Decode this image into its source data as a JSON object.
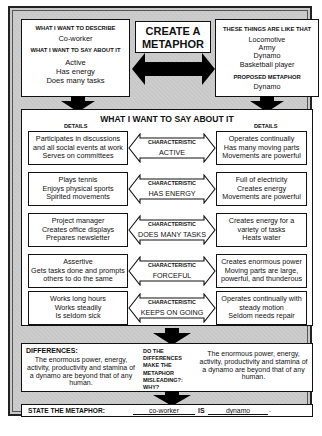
{
  "title": "CREATE A METAPHOR",
  "title_lines": [
    "CREATE A",
    "METAPHOR"
  ],
  "describe": {
    "label": "WHAT I WANT TO DESCRIBE",
    "value": "Co-worker",
    "say_label": "WHAT I WANT TO SAY ABOUT IT",
    "say_items": [
      "Active",
      "Has energy",
      "Does many tasks"
    ]
  },
  "like_that": {
    "label": "THESE THINGS ARE LIKE THAT",
    "items": [
      "Locomotive",
      "Army",
      "Dynamo",
      "Basketball player"
    ],
    "proposed_label": "PROPOSED METAPHOR",
    "proposed_value": "Dynamo"
  },
  "say_section": {
    "title": "WHAT I WANT TO SAY ABOUT IT",
    "left_header": "DETAILS",
    "right_header": "DETAILS",
    "characteristic_label": "CHARACTERISTIC",
    "rows": [
      {
        "left": [
          "Participates in discussions",
          "and all social events at work",
          "Serves on committees"
        ],
        "characteristic": "ACTIVE",
        "right": [
          "Operates continually",
          "Has many moving parts",
          "Movements are powerful"
        ]
      },
      {
        "left": [
          "Plays tennis",
          "Enjoys physical sports",
          "Spirited movements"
        ],
        "characteristic": "HAS ENERGY",
        "right": [
          "Full of electricity",
          "Creates energy",
          "Movements are powerful"
        ]
      },
      {
        "left": [
          "Project manager",
          "Creates office displays",
          "Prepares newsletter"
        ],
        "characteristic": "DOES MANY TASKS",
        "right": [
          "Creates energy for a",
          "variety of tasks",
          "Heats water"
        ]
      },
      {
        "left": [
          "Assertive",
          "Gets tasks done and prompts",
          "others to do the same"
        ],
        "characteristic": "FORCEFUL",
        "right": [
          "Creates enormous power",
          "Moving parts are large,",
          "powerful, and thunderous"
        ]
      },
      {
        "left": [
          "Works long hours",
          "Works steadily",
          "Is seldom sick"
        ],
        "characteristic": "KEEPS ON GOING",
        "right": [
          "Operates continually with",
          "steady motion",
          "Seldom needs repair"
        ]
      }
    ]
  },
  "differences": {
    "label": "DIFFERENCES:",
    "text": "The enormous power, energy, activity, productivity and stamina of a dynamo are beyond that of any human.",
    "question": "DO THE DIFFERENCES MAKE THE METAPHOR MISLEADING?: WHY?",
    "question_lines": [
      "DO THE",
      "DIFFERENCES",
      "MAKE THE",
      "METAPHOR",
      "MISLEADING?:",
      "WHY?"
    ],
    "answer": "The enormous power, energy, activity, productivity and stamina of a dynamo are beyond that of any human."
  },
  "state": {
    "label": "STATE THE METAPHOR:",
    "subject": "co-worker",
    "connector": "IS",
    "metaphor": "dynamo",
    "period": "."
  },
  "colors": {
    "frame_bg": "#c9c9c9",
    "box_bg": "#ffffff",
    "ink": "#111111"
  }
}
